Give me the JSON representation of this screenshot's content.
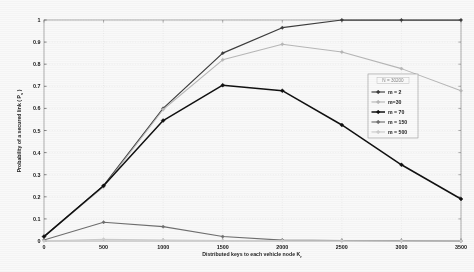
{
  "figure": {
    "background": "#fdfdfd",
    "plot_left": 44,
    "plot_right": 461,
    "plot_top": 20,
    "plot_bottom": 241
  },
  "chart_data": {
    "type": "line",
    "title": "",
    "xlabel": "Distributed keys to  each vehicle node K",
    "xlabel_subscript": "r",
    "ylabel": "Probability of a secured link ( P",
    "ylabel_subscript": "s",
    "ylabel_close": " )",
    "x": [
      0,
      500,
      1000,
      1500,
      2000,
      2500,
      3000,
      3500
    ],
    "xticklabels": [
      "0",
      "500",
      "1000",
      "1500",
      "2000",
      "2500",
      "3000",
      "3500"
    ],
    "yticklabels": [
      "0",
      "0.1",
      "0.2",
      "0.3",
      "0.4",
      "0.5",
      "0.6",
      "0.7",
      "0.8",
      "0.9",
      "1"
    ],
    "xlim": [
      0,
      3500
    ],
    "ylim": [
      0,
      1
    ],
    "grid": true,
    "legend_position": "right",
    "series": [
      {
        "name": "m = 2",
        "color": "#3a3a3a",
        "marker": "diamond",
        "values": [
          0.02,
          0.25,
          0.6,
          0.85,
          0.965,
          1.0,
          1.0,
          1.0
        ]
      },
      {
        "name": "m=30",
        "color": "#b9b9b9",
        "marker": "diamond",
        "values": [
          0.02,
          0.245,
          0.595,
          0.82,
          0.89,
          0.855,
          0.78,
          0.68
        ]
      },
      {
        "name": "m = 70",
        "color": "#0d0d0d",
        "marker": "diamond",
        "values": [
          0.02,
          0.25,
          0.545,
          0.705,
          0.68,
          0.525,
          0.345,
          0.19
        ]
      },
      {
        "name": "m = 150",
        "color": "#6e6e6e",
        "marker": "diamond",
        "values": [
          0.005,
          0.085,
          0.065,
          0.02,
          0.004,
          0.002,
          0.001,
          0.0
        ]
      },
      {
        "name": "m = 500",
        "color": "#cfcfcf",
        "marker": "diamond",
        "values": [
          0.0,
          0.008,
          0.004,
          0.002,
          0.001,
          0.001,
          0.0,
          0.0
        ]
      }
    ]
  },
  "legend": {
    "title": "N = 30200",
    "entries": [
      {
        "label": "m = 2",
        "color": "#3a3a3a"
      },
      {
        "label": "m=30",
        "color": "#b9b9b9"
      },
      {
        "label": "m = 70",
        "color": "#0d0d0d"
      },
      {
        "label": "m = 150",
        "color": "#6e6e6e"
      },
      {
        "label": "m = 500",
        "color": "#cfcfcf"
      }
    ]
  }
}
